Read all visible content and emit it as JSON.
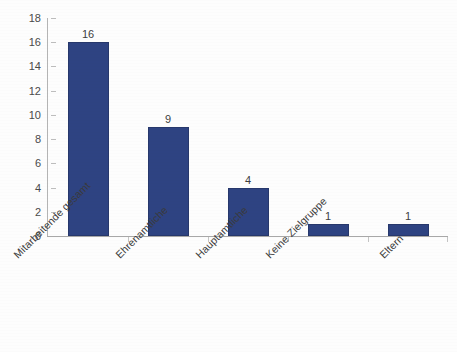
{
  "chart_data": {
    "type": "bar",
    "title": "",
    "subtitle": "",
    "xlabel": "",
    "ylabel": "",
    "categories": [
      "Mitarbeitende gesamt",
      "Ehrenamtliche",
      "Hauptamtliche",
      "Keine Zielgruppe",
      "Eltern"
    ],
    "values": [
      16,
      9,
      4,
      1,
      1
    ],
    "data_labels": [
      "16",
      "9",
      "4",
      "1",
      "1"
    ],
    "ylim": [
      0,
      18
    ],
    "ytick_step": 2,
    "ytick_labels": [
      "18",
      "16",
      "14",
      "12",
      "10",
      "8",
      "6",
      "4",
      "2",
      "0"
    ],
    "ytick_values": [
      18,
      16,
      14,
      12,
      10,
      8,
      6,
      4,
      2,
      0
    ],
    "grid": false,
    "legend": null,
    "legend_position": "none",
    "bar_color": "#2e4382",
    "bar_border_color": "#27386c",
    "axis_color": "#b4b4b4",
    "text_color": "#3d3d3d",
    "background_color": "#fdfdfd",
    "category_label_rotation": -45
  }
}
